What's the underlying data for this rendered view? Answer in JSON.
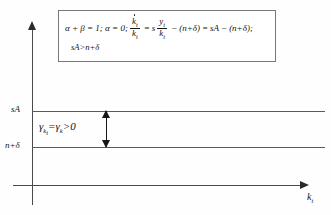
{
  "figure": {
    "background_color": "#fefefe",
    "line_color": "#5a5a5a",
    "axis_color": "#4a4a4a"
  },
  "formula_box": {
    "border_color": "#777777",
    "line1": {
      "lead": "α + β = 1; α = 0;",
      "frac1_num": "k",
      "frac1_num_sub": "t",
      "frac1_den": "k",
      "frac1_den_sub": "t",
      "equals1": "=",
      "s": "s",
      "frac2_num": "y",
      "frac2_num_sub": "t",
      "frac2_den": "k",
      "frac2_den_sub": "t",
      "minus": "−",
      "term1": "(n+δ)",
      "equals2": "=",
      "term2": "sA",
      "minus2": "−",
      "term3": "(n+δ);",
      "full_text": "α+β=1;α=0; k̇ₜ/kₜ = s·yₜ/kₜ − (n+δ) = sA − (n+δ);"
    },
    "line2": {
      "text": "sA>n+δ"
    }
  },
  "axes": {
    "x_label": "k",
    "x_label_sub": "t",
    "y_tick_upper": "sA",
    "y_tick_lower": "n+δ"
  },
  "annotations": {
    "gamma_lhs": "γ",
    "gamma_lhs_sub": "k",
    "gamma_lhs_sub_sub": "t",
    "gamma_equals": "=",
    "gamma_rhs": "γ",
    "gamma_rhs_sub": "k",
    "gamma_compare": ">0",
    "gamma_full": "γₖₜ = γₖ > 0"
  },
  "chart_data": {
    "type": "line",
    "xlabel": "k_t",
    "ylabel": "",
    "grid": false,
    "legend": null,
    "series": [
      {
        "name": "sA",
        "label": "sA",
        "type": "horizontal-line",
        "y_value_label": "sA",
        "x_from": 0,
        "x_to": 1
      },
      {
        "name": "n+delta",
        "label": "n+δ",
        "type": "horizontal-line",
        "y_value_label": "n+δ",
        "x_from": 0,
        "x_to": 1
      }
    ],
    "annotations": [
      {
        "type": "double-arrow",
        "label": "γₖₜ = γₖ > 0",
        "between": [
          "sA",
          "n+δ"
        ]
      }
    ]
  }
}
